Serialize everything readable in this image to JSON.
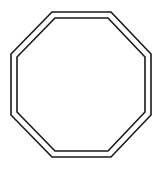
{
  "diagram": {
    "shape": "octagon",
    "style": "double-outline",
    "stroke_color": "#1a1a1a",
    "fill_color": "#ffffff",
    "background": "#ffffff",
    "outer": {
      "points": "52,12 111,12 151,54 151,115 111,157 52,157 11,115 11,54",
      "stroke_width": 1.6
    },
    "inner": {
      "points": "55,18 108,18 145,57 145,112 108,151 55,151 17,112 17,57",
      "stroke_width": 1.6
    }
  }
}
